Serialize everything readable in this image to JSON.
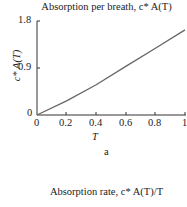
{
  "chart_data": {
    "type": "line",
    "title": "Absorption per breath, c* A(T)",
    "xlabel": "T",
    "ylabel": "c* A(T)",
    "x": [
      0,
      0.2,
      0.4,
      0.6,
      0.8,
      1.0
    ],
    "series": [
      {
        "name": "c* A(T)",
        "values": [
          0,
          0.27,
          0.58,
          0.93,
          1.28,
          1.63
        ]
      }
    ],
    "xlim": [
      0,
      1
    ],
    "ylim": [
      0,
      1.8
    ],
    "xticks": [
      "0",
      "0.2",
      "0.4",
      "0.6",
      "0.8",
      "1"
    ],
    "yticks": [
      "0",
      "0.9",
      "1.8"
    ],
    "grid": false,
    "legend": null
  },
  "labels": {
    "title": "Absorption per breath, c* A(T)",
    "ylabel": "c* A(T)",
    "xlabel": "T",
    "subfigure": "a",
    "next_title": "Absorption rate, c* A(T)/T",
    "yticks": [
      "1.8",
      "0.9",
      "0"
    ],
    "xticks": [
      "0",
      "0.2",
      "0.4",
      "0.6",
      "0.8",
      "1"
    ]
  }
}
